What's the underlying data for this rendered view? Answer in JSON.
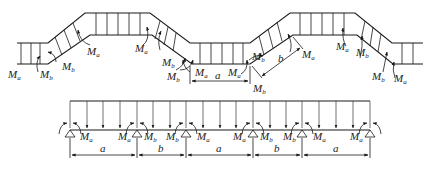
{
  "top_diagram": {
    "title": "Folded (zig-zag) plate structure with end moments",
    "moment_labels": [
      {
        "id": "m1",
        "sym": "M",
        "sub": "a",
        "x": 8,
        "y": 78
      },
      {
        "id": "m2",
        "sym": "M",
        "sub": "b",
        "x": 40,
        "y": 78
      },
      {
        "id": "m3",
        "sym": "M",
        "sub": "b",
        "x": 60,
        "y": 70
      },
      {
        "id": "m4",
        "sym": "M",
        "sub": "a",
        "x": 87,
        "y": 55
      },
      {
        "id": "m5",
        "sym": "M",
        "sub": "a",
        "x": 135,
        "y": 55
      },
      {
        "id": "m6",
        "sym": "M",
        "sub": "b",
        "x": 163,
        "y": 65
      },
      {
        "id": "m7",
        "sym": "M",
        "sub": "b",
        "x": 167,
        "y": 78
      },
      {
        "id": "m8",
        "sym": "M",
        "sub": "a",
        "x": 194,
        "y": 76
      },
      {
        "id": "m9",
        "sym": "M",
        "sub": "a",
        "x": 229,
        "y": 76
      },
      {
        "id": "m10",
        "sym": "M",
        "sub": "b",
        "x": 250,
        "y": 60
      },
      {
        "id": "m11",
        "sym": "M",
        "sub": "b",
        "x": 254,
        "y": 91
      },
      {
        "id": "m12",
        "sym": "M",
        "sub": "a",
        "x": 299,
        "y": 58
      },
      {
        "id": "m13",
        "sym": "M",
        "sub": "a",
        "x": 336,
        "y": 50
      },
      {
        "id": "m14",
        "sym": "M",
        "sub": "b",
        "x": 356,
        "y": 56
      },
      {
        "id": "m15",
        "sym": "M",
        "sub": "b",
        "x": 373,
        "y": 80
      },
      {
        "id": "m16",
        "sym": "M",
        "sub": "a",
        "x": 394,
        "y": 82
      }
    ],
    "dimension_labels": [
      {
        "id": "da",
        "text": "a",
        "x": 215,
        "y": 80
      },
      {
        "id": "db",
        "text": "b",
        "x": 278,
        "y": 62
      }
    ]
  },
  "bottom_diagram": {
    "title": "Equivalent continuous beam",
    "spans": [
      "a",
      "b",
      "a",
      "b",
      "a"
    ],
    "support_labels": [
      {
        "id": "s1",
        "sym": "M",
        "sub": "a",
        "x": 81,
        "y": 139
      },
      {
        "id": "s2",
        "sym": "M",
        "sub": "a",
        "x": 118,
        "y": 139
      },
      {
        "id": "s3",
        "sym": "M",
        "sub": "b",
        "x": 144,
        "y": 139
      },
      {
        "id": "s4",
        "sym": "M",
        "sub": "b",
        "x": 166,
        "y": 139
      },
      {
        "id": "s5",
        "sym": "M",
        "sub": "a",
        "x": 197,
        "y": 139
      },
      {
        "id": "s6",
        "sym": "M",
        "sub": "a",
        "x": 233,
        "y": 139
      },
      {
        "id": "s7",
        "sym": "M",
        "sub": "b",
        "x": 261,
        "y": 139
      },
      {
        "id": "s8",
        "sym": "M",
        "sub": "b",
        "x": 283,
        "y": 139
      },
      {
        "id": "s9",
        "sym": "M",
        "sub": "a",
        "x": 313,
        "y": 139
      },
      {
        "id": "s10",
        "sym": "M",
        "sub": "a",
        "x": 350,
        "y": 139
      }
    ],
    "span_labels": [
      {
        "id": "sp1",
        "text": "a",
        "x": 102,
        "y": 158
      },
      {
        "id": "sp2",
        "text": "b",
        "x": 160,
        "y": 158
      },
      {
        "id": "sp3",
        "text": "a",
        "x": 218,
        "y": 158
      },
      {
        "id": "sp4",
        "text": "b",
        "x": 276,
        "y": 158
      },
      {
        "id": "sp5",
        "text": "a",
        "x": 334,
        "y": 158
      }
    ]
  }
}
